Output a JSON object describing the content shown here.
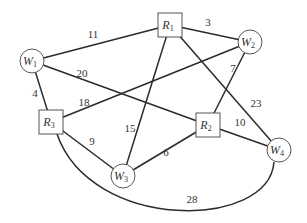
{
  "diagram": {
    "type": "weighted-graph",
    "nodes": [
      {
        "id": "R1",
        "letter": "R",
        "sub": "1",
        "shape": "square",
        "x": 170,
        "y": 25
      },
      {
        "id": "W1",
        "letter": "W",
        "sub": "1",
        "shape": "circle",
        "x": 32,
        "y": 61
      },
      {
        "id": "W2",
        "letter": "W",
        "sub": "2",
        "shape": "circle",
        "x": 250,
        "y": 42
      },
      {
        "id": "R3",
        "letter": "R",
        "sub": "3",
        "shape": "square",
        "x": 51,
        "y": 122
      },
      {
        "id": "R2",
        "letter": "R",
        "sub": "2",
        "shape": "square",
        "x": 208,
        "y": 125
      },
      {
        "id": "W3",
        "letter": "W",
        "sub": "3",
        "shape": "circle",
        "x": 123,
        "y": 176
      },
      {
        "id": "W4",
        "letter": "W",
        "sub": "4",
        "shape": "circle",
        "x": 279,
        "y": 150
      }
    ],
    "edges": [
      {
        "from": "W1",
        "to": "R1",
        "weight": "11",
        "lx": 93,
        "ly": 38
      },
      {
        "from": "R1",
        "to": "W2",
        "weight": "3",
        "lx": 208,
        "ly": 26
      },
      {
        "from": "W1",
        "to": "R2",
        "weight": "20",
        "lx": 82,
        "ly": 77
      },
      {
        "from": "W2",
        "to": "R2",
        "weight": "7",
        "lx": 233,
        "ly": 72
      },
      {
        "from": "W1",
        "to": "R3",
        "weight": "4",
        "lx": 35,
        "ly": 97
      },
      {
        "from": "R3",
        "to": "W2",
        "weight": "18",
        "lx": 84,
        "ly": 106
      },
      {
        "from": "R1",
        "to": "W4",
        "weight": "23",
        "lx": 256,
        "ly": 107
      },
      {
        "from": "R1",
        "to": "W3",
        "weight": "15",
        "lx": 130,
        "ly": 132
      },
      {
        "from": "R3",
        "to": "W3",
        "weight": "9",
        "lx": 92,
        "ly": 145
      },
      {
        "from": "R2",
        "to": "W4",
        "weight": "10",
        "lx": 240,
        "ly": 126
      },
      {
        "from": "W3",
        "to": "R2",
        "weight": "6",
        "lx": 166,
        "ly": 156
      },
      {
        "from": "R3",
        "to": "W4",
        "weight": "28",
        "lx": 192,
        "ly": 203,
        "curved": true
      }
    ]
  }
}
